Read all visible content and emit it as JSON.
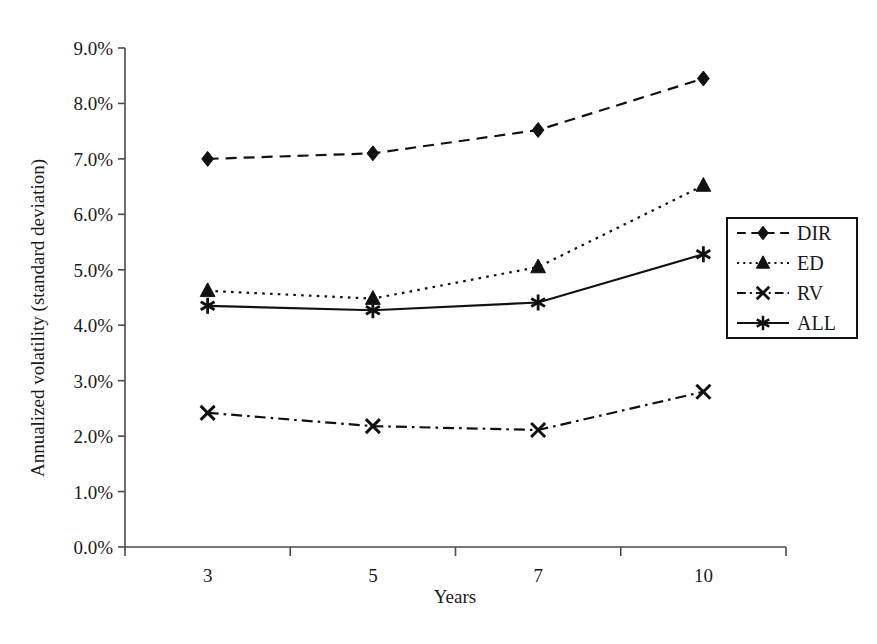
{
  "chart_data": {
    "type": "line",
    "title": "",
    "xlabel": "Years",
    "ylabel": "Annualized volatility (standard deviation)",
    "categories": [
      "3",
      "5",
      "7",
      "10"
    ],
    "x": [
      3,
      5,
      7,
      10
    ],
    "ylim": [
      0.0,
      9.0
    ],
    "yticks": [
      "0.0%",
      "1.0%",
      "2.0%",
      "3.0%",
      "4.0%",
      "5.0%",
      "6.0%",
      "7.0%",
      "8.0%",
      "9.0%"
    ],
    "ytick_values": [
      0.0,
      1.0,
      2.0,
      3.0,
      4.0,
      5.0,
      6.0,
      7.0,
      8.0,
      9.0
    ],
    "unit": "%",
    "grid": false,
    "legend_position": "right",
    "series": [
      {
        "name": "DIR",
        "values": [
          7.0,
          7.1,
          7.52,
          8.45
        ],
        "marker": "diamond",
        "dash": "dashed",
        "color": "#111111"
      },
      {
        "name": "ED",
        "values": [
          4.62,
          4.48,
          5.05,
          6.52
        ],
        "marker": "triangle",
        "dash": "dotted",
        "color": "#111111"
      },
      {
        "name": "RV",
        "values": [
          2.42,
          2.18,
          2.11,
          2.8
        ],
        "marker": "x",
        "dash": "dash-dot",
        "color": "#111111"
      },
      {
        "name": "ALL",
        "values": [
          4.35,
          4.27,
          4.41,
          5.28
        ],
        "marker": "asterisk",
        "dash": "solid",
        "color": "#111111"
      }
    ]
  },
  "legend": {
    "items": [
      {
        "label": "DIR"
      },
      {
        "label": "ED"
      },
      {
        "label": "RV"
      },
      {
        "label": "ALL"
      }
    ]
  },
  "axes": {
    "x_title": "Years",
    "y_title": "Annualized volatility (standard deviation)"
  }
}
